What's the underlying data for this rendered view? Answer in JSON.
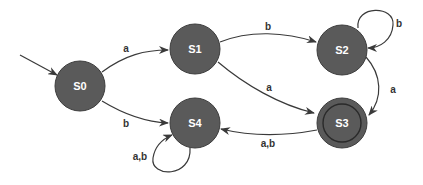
{
  "diagram": {
    "type": "finite-state-automaton",
    "colors": {
      "node_fill": "#5a5a5a",
      "node_stroke": "#3c3c3c",
      "edge": "#3a3a3a",
      "label": "#333333",
      "node_text": "#ffffff"
    },
    "start_state": "S0",
    "accept_states": [
      "S3"
    ],
    "states": [
      {
        "id": "S0",
        "label": "S0"
      },
      {
        "id": "S1",
        "label": "S1"
      },
      {
        "id": "S2",
        "label": "S2"
      },
      {
        "id": "S3",
        "label": "S3"
      },
      {
        "id": "S4",
        "label": "S4"
      }
    ],
    "transitions": [
      {
        "from": "S0",
        "to": "S1",
        "label": "a"
      },
      {
        "from": "S0",
        "to": "S4",
        "label": "b"
      },
      {
        "from": "S1",
        "to": "S2",
        "label": "b"
      },
      {
        "from": "S1",
        "to": "S3",
        "label": "a"
      },
      {
        "from": "S2",
        "to": "S2",
        "label": "b"
      },
      {
        "from": "S2",
        "to": "S3",
        "label": "a"
      },
      {
        "from": "S3",
        "to": "S4",
        "label": "a,b"
      },
      {
        "from": "S4",
        "to": "S4",
        "label": "a,b"
      }
    ]
  }
}
